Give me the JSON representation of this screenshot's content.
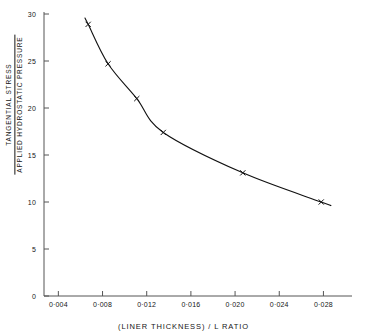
{
  "chart_data": {
    "type": "line",
    "title": "",
    "subtitle": "",
    "xlabel": "(LINER THICKNESS) / L  RATIO",
    "ylabel_numerator": "TANGENTIAL STRESS",
    "ylabel_denominator": "APPLIED HYDROSTATIC PRESSURE",
    "ylabel": "TANGENTIAL STRESS / APPLIED HYDROSTATIC PRESSURE",
    "xlim": [
      0.0027,
      0.0295
    ],
    "ylim": [
      0,
      30
    ],
    "grid": false,
    "legend": "none",
    "marker": "x",
    "line_color": "#111111",
    "marker_color": "#111111",
    "axis_color": "#555555",
    "xticks": [
      0.004,
      0.008,
      0.012,
      0.016,
      0.02,
      0.024,
      0.028
    ],
    "xtick_labels": [
      "0·004",
      "0·008",
      "0·012",
      "0·016",
      "0·020",
      "0·024",
      "0·028"
    ],
    "yticks": [
      0,
      5,
      10,
      15,
      20,
      25,
      30
    ],
    "ytick_labels": [
      "0",
      "5",
      "10",
      "15",
      "20",
      "25",
      "30"
    ],
    "series": [
      {
        "name": "tangential stress ratio",
        "x": [
          0.0067,
          0.0085,
          0.0111,
          0.0135,
          0.0207,
          0.0278
        ],
        "values": [
          28.9,
          24.7,
          21.0,
          17.4,
          13.1,
          10.0
        ]
      }
    ],
    "points": [
      {
        "x": 0.0067,
        "y": 28.9
      },
      {
        "x": 0.0085,
        "y": 24.7
      },
      {
        "x": 0.0111,
        "y": 21.0
      },
      {
        "x": 0.0135,
        "y": 17.4
      },
      {
        "x": 0.0207,
        "y": 13.1
      },
      {
        "x": 0.0278,
        "y": 10.0
      }
    ]
  }
}
